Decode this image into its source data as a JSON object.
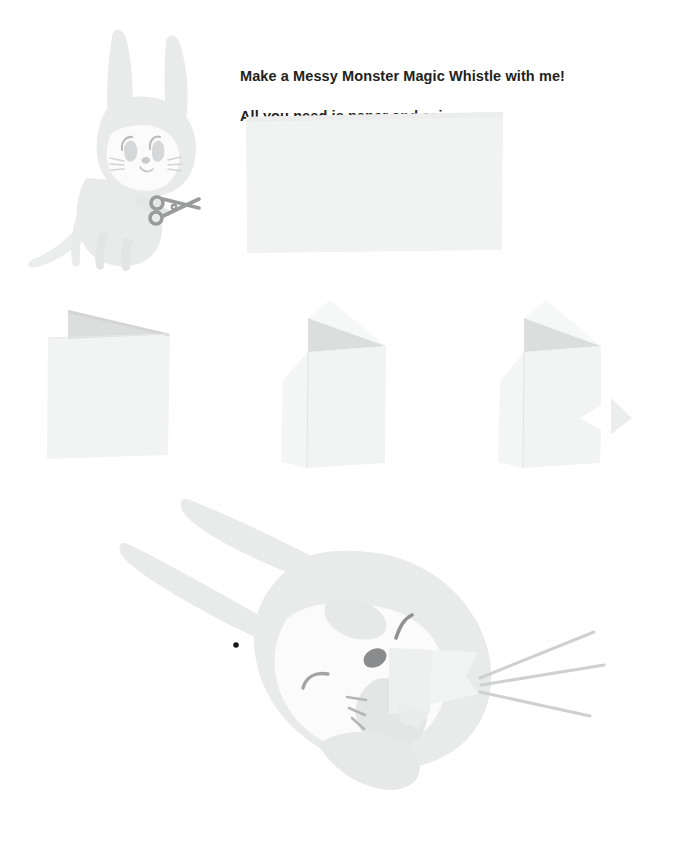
{
  "page": {
    "background_color": "#ffffff",
    "width": 693,
    "height": 853
  },
  "instructions": {
    "line1": "Make a Messy Monster Magic Whistle with me!",
    "line2": "All you need is paper and scissors.",
    "text_color": "#231f20"
  },
  "colors": {
    "character_body": "#e9eaea",
    "character_body_shadow": "#e2e4e3",
    "character_face": "#fbfbfb",
    "paper_light": "#f3f4f4",
    "paper_mid": "#eceded",
    "paper_fold_shadow": "#dcdede",
    "line_dark": "#8f9091",
    "line_soft": "#c9cbcb",
    "eye_dark": "#7d7e80",
    "pupil_black": "#1a1a1a",
    "sound_line": "#cfd1d1"
  },
  "scene_1": {
    "label": "Cat character holding scissors",
    "character_name": "messy-monster-cat",
    "props": [
      "scissors"
    ],
    "paper_sheet": {
      "label": "blank sheet of paper",
      "x": 245,
      "y": 112,
      "width": 258,
      "height": 140
    }
  },
  "fold_steps": [
    {
      "step": 1,
      "label": "Paper folded in half with one corner folded down",
      "x": 45,
      "y": 300,
      "flap_side": "top-left"
    },
    {
      "step": 2,
      "label": "Folded paper with left side flap opened out",
      "x": 285,
      "y": 295,
      "flap_side": "left"
    },
    {
      "step": 3,
      "label": "Folded paper with a triangular notch cut on the right edge",
      "x": 500,
      "y": 295,
      "flap_side": "right-notch"
    }
  ],
  "scene_2": {
    "label": "Cat blowing the finished paper whistle",
    "character_name": "messy-monster-cat-blowing",
    "whistle_label": "finished paper whistle",
    "sound_lines_count": 3
  }
}
